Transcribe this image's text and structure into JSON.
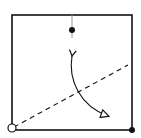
{
  "diagram": {
    "width": 141,
    "height": 138,
    "colors": {
      "stroke": "#111111",
      "guide": "#9a9a9a",
      "background": "#ffffff"
    },
    "square": {
      "x": 12,
      "y": 15,
      "size": 120
    },
    "top_point": {
      "cx": 72,
      "cy": 30,
      "r": 3
    },
    "corner_open_circle": {
      "cx": 12,
      "cy": 128,
      "r": 4
    },
    "corner_filled_dot": {
      "cx": 132,
      "cy": 130,
      "r": 3
    },
    "dashed_axis": {
      "x1": 12,
      "y1": 128,
      "x2": 128,
      "y2": 65
    },
    "rotation_arrow": {
      "start_icon": "filled-arrowhead",
      "end_icon": "open-triangle-arrowhead"
    }
  }
}
